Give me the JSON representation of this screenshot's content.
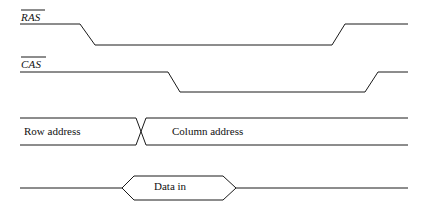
{
  "diagram": {
    "type": "timing-diagram",
    "background_color": "#ffffff",
    "line_color": "#1a1a1a",
    "signals": [
      {
        "name": "RAS",
        "label": "RAS",
        "active_low": true,
        "overlined": true,
        "high_level_y": 24,
        "low_level_y": 45,
        "start_x": 20,
        "end_x": 408,
        "falling_edge": {
          "from_x": 80,
          "to_x": 95
        },
        "rising_edge": {
          "from_x": 332,
          "to_x": 345
        }
      },
      {
        "name": "CAS",
        "label": "CAS",
        "active_low": true,
        "overlined": true,
        "high_level_y": 72,
        "low_level_y": 92,
        "start_x": 20,
        "end_x": 408,
        "falling_edge": {
          "from_x": 168,
          "to_x": 180
        },
        "rising_edge": {
          "from_x": 365,
          "to_x": 378
        }
      }
    ],
    "address_bus": {
      "top_y": 118,
      "bottom_y": 145,
      "start_x": 20,
      "end_x": 408,
      "crossing_from_x": 136,
      "crossing_to_x": 146,
      "segments": [
        {
          "label": "Row address"
        },
        {
          "label": "Column address"
        }
      ]
    },
    "data_bus": {
      "line_y": 188,
      "start_x": 20,
      "end_x": 408,
      "valid_window": {
        "label": "Data in",
        "left_point_x": 122,
        "left_shoulder_x": 134,
        "right_shoulder_x": 223,
        "right_point_x": 236,
        "top_y": 176,
        "bottom_y": 200
      }
    }
  }
}
